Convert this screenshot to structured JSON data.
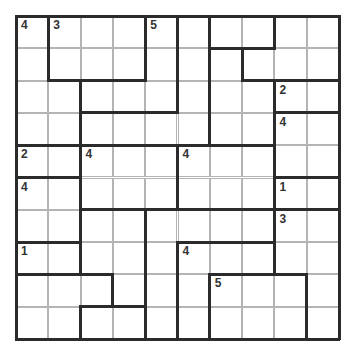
{
  "puzzle": {
    "rows": 10,
    "cols": 10,
    "cell_size": 32.3,
    "line_color": "#2b2b2b",
    "grid_color": "#b4b4b4",
    "clue_color": "#333333",
    "regions": [
      [
        1,
        2,
        2,
        2,
        3,
        4,
        5,
        5,
        6,
        6
      ],
      [
        1,
        2,
        2,
        2,
        3,
        4,
        7,
        6,
        6,
        6
      ],
      [
        1,
        1,
        3,
        3,
        3,
        4,
        7,
        7,
        8,
        8
      ],
      [
        1,
        1,
        4,
        4,
        4,
        4,
        7,
        7,
        9,
        9
      ],
      [
        10,
        10,
        11,
        11,
        11,
        12,
        12,
        12,
        9,
        9
      ],
      [
        13,
        13,
        11,
        11,
        11,
        12,
        12,
        12,
        14,
        14
      ],
      [
        13,
        13,
        15,
        15,
        16,
        16,
        16,
        16,
        17,
        17
      ],
      [
        18,
        18,
        15,
        15,
        16,
        19,
        19,
        19,
        17,
        17
      ],
      [
        20,
        20,
        20,
        15,
        16,
        19,
        22,
        22,
        22,
        17
      ],
      [
        20,
        20,
        21,
        21,
        16,
        19,
        22,
        22,
        22,
        17
      ]
    ],
    "clues": [
      {
        "row": 0,
        "col": 0,
        "value": "4"
      },
      {
        "row": 0,
        "col": 1,
        "value": "3"
      },
      {
        "row": 0,
        "col": 4,
        "value": "5"
      },
      {
        "row": 2,
        "col": 8,
        "value": "2"
      },
      {
        "row": 3,
        "col": 8,
        "value": "4"
      },
      {
        "row": 4,
        "col": 0,
        "value": "2"
      },
      {
        "row": 4,
        "col": 2,
        "value": "4"
      },
      {
        "row": 4,
        "col": 5,
        "value": "4"
      },
      {
        "row": 5,
        "col": 0,
        "value": "4"
      },
      {
        "row": 5,
        "col": 8,
        "value": "1"
      },
      {
        "row": 6,
        "col": 8,
        "value": "3"
      },
      {
        "row": 7,
        "col": 0,
        "value": "1"
      },
      {
        "row": 7,
        "col": 5,
        "value": "4"
      },
      {
        "row": 8,
        "col": 6,
        "value": "5"
      }
    ]
  }
}
